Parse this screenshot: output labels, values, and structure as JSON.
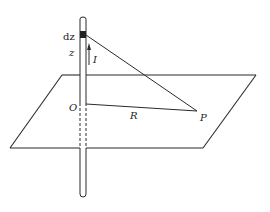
{
  "figure": {
    "labels": {
      "element": "dz",
      "height": "z",
      "current": "I",
      "origin": "O",
      "distance": "R",
      "point": "P"
    },
    "colors": {
      "line": "#2a2a2a",
      "background": "#ffffff"
    }
  }
}
